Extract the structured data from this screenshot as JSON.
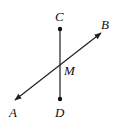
{
  "diagram": {
    "type": "geometry",
    "colors": {
      "line": "#222222",
      "segment": "#555555",
      "point": "#111111",
      "background": "#ffffff"
    },
    "points": [
      {
        "id": "C",
        "label": "C",
        "x": 60,
        "y": 29,
        "label_x": 55,
        "label_y": 21,
        "dot": true
      },
      {
        "id": "D",
        "label": "D",
        "x": 60,
        "y": 99,
        "label_x": 55,
        "label_y": 117,
        "dot": true
      },
      {
        "id": "M",
        "label": "M",
        "x": 60,
        "y": 63,
        "label_x": 64,
        "label_y": 75,
        "dot": false
      },
      {
        "id": "A",
        "label": "A",
        "x": 15,
        "y": 100,
        "label_x": 9,
        "label_y": 117,
        "dot": false
      },
      {
        "id": "B",
        "label": "B",
        "x": 101,
        "y": 33,
        "label_x": 101,
        "label_y": 29,
        "dot": false
      }
    ],
    "segments": [
      {
        "from": "C",
        "to": "D",
        "name": "CD"
      }
    ],
    "lines": [
      {
        "through": [
          "A",
          "B"
        ],
        "name": "AB",
        "arrows": "both"
      }
    ]
  }
}
